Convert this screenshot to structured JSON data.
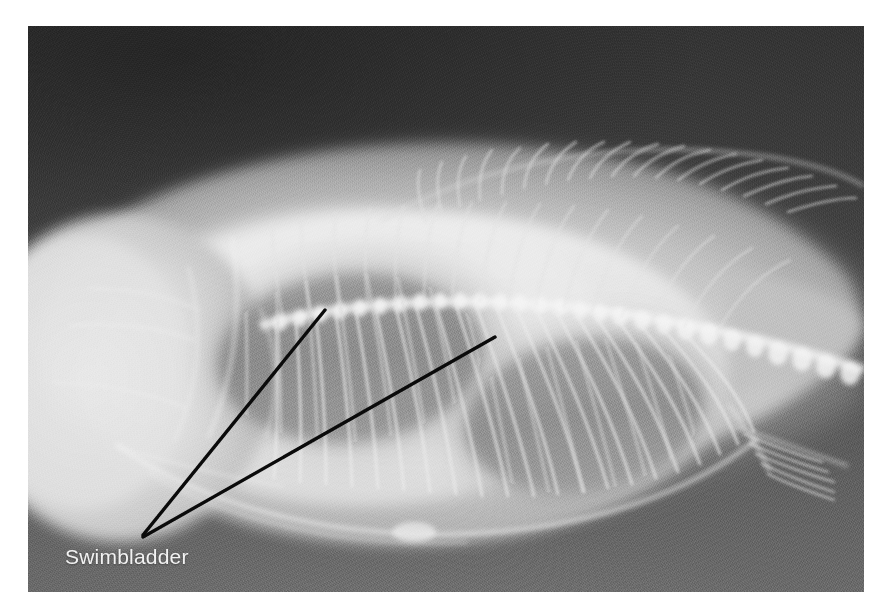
{
  "image": {
    "kind": "radiograph",
    "subject": "deep-bodied fish lateral radiograph",
    "plate": {
      "x": 28,
      "y": 26,
      "width": 836,
      "height": 566
    },
    "canvas": {
      "width": 887,
      "height": 613
    },
    "background_color": "#ffffff"
  },
  "annotations": {
    "label_text": "Swimbladder",
    "label_color": "#f2f2f2",
    "leader_color": "#0a0a0a",
    "leader_width_px": 3,
    "leaders": [
      {
        "name": "leader-to-anterior-chamber",
        "from_x": 143,
        "from_y": 535,
        "to_x": 325,
        "to_y": 310
      },
      {
        "name": "leader-to-posterior-chamber",
        "from_x": 143,
        "from_y": 537,
        "to_x": 495,
        "to_y": 337
      }
    ],
    "label_position": {
      "x": 65,
      "y": 565
    }
  },
  "anatomy": {
    "film_dark": "#343434",
    "film_light": "#6a6a6a",
    "body_tissue": "#c9c9c9",
    "bone_bright": "#f2f2f2",
    "swimbladder_gas": "#8c8c8c",
    "structures": [
      {
        "name": "head-skull",
        "label": "Head / skull and opercular bones"
      },
      {
        "name": "vertebral-column",
        "label": "Vertebral column"
      },
      {
        "name": "ribs",
        "label": "Rib series"
      },
      {
        "name": "dorsal-fin-rays",
        "label": "Dorsal fin rays"
      },
      {
        "name": "anal-fin-rays",
        "label": "Anal fin rays"
      },
      {
        "name": "caudal-peduncle",
        "label": "Caudal peduncle"
      },
      {
        "name": "swimbladder-anterior-chamber",
        "label": "Swimbladder anterior chamber"
      },
      {
        "name": "swimbladder-posterior-chamber",
        "label": "Swimbladder posterior chamber"
      },
      {
        "name": "body-outline",
        "label": "Body silhouette"
      }
    ]
  }
}
